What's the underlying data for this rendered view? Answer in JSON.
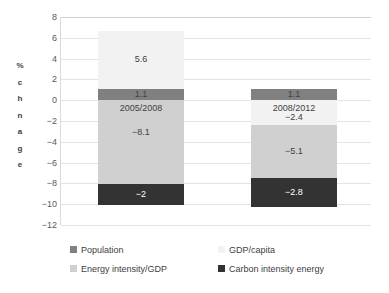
{
  "chart_data": {
    "type": "bar",
    "title": "",
    "subtitle": "",
    "xlabel": "",
    "ylabel": "% chnage",
    "ylabel_letters": [
      "%",
      "c",
      "h",
      "n",
      "a",
      "g",
      "e"
    ],
    "ylim": [
      -12,
      8
    ],
    "ytick_values": [
      8,
      6,
      4,
      2,
      0,
      -2,
      -4,
      -6,
      -8,
      -10,
      -12
    ],
    "ytick_labels": [
      "8",
      "6",
      "4",
      "2",
      "0",
      "-2",
      "-4",
      "-6",
      "-8",
      "-10",
      "-12"
    ],
    "grid": true,
    "stacked": true,
    "legend_position": "bottom",
    "categories": [
      "2005/2008",
      "2008/2012"
    ],
    "series": [
      {
        "name": "Population",
        "color": "#808080",
        "values": [
          1.1,
          1.1
        ],
        "labels": [
          "1.1",
          "1.1"
        ]
      },
      {
        "name": "GDP/capita",
        "color": "#F2F2F2",
        "values": [
          5.6,
          -2.4
        ],
        "labels": [
          "5.6",
          "-2.4"
        ]
      },
      {
        "name": "Energy intensity/GDP",
        "color": "#D0D0D0",
        "values": [
          -8.1,
          -5.1
        ],
        "labels": [
          "-8.1",
          "-5.1"
        ]
      },
      {
        "name": "Carbon intensity energy",
        "color": "#333333",
        "values": [
          -2,
          -2.8
        ],
        "labels": [
          "-2",
          "-2.8"
        ]
      }
    ],
    "legend_entries": [
      {
        "label": "Population",
        "color": "#808080"
      },
      {
        "label": "GDP/capita",
        "color": "#F2F2F2"
      },
      {
        "label": "Energy intensity/GDP",
        "color": "#D0D0D0"
      },
      {
        "label": "Carbon intensity energy",
        "color": "#333333"
      }
    ],
    "bar_annotations": [
      {
        "category": "2005/2008",
        "text": "2005/2008"
      },
      {
        "category": "2008/2012",
        "text": "2008/2012"
      }
    ]
  }
}
